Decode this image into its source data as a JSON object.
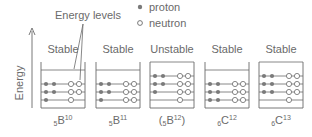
{
  "legend": {
    "proton_label": "proton",
    "neutron_label": "neutron"
  },
  "annotation": {
    "energy_levels": "Energy levels"
  },
  "axis": {
    "ylabel": "Energy"
  },
  "colors": {
    "proton_fill": "#7a7a7a",
    "neutron_fill": "#ffffff",
    "line": "#6a6a6a"
  },
  "nuclei": [
    {
      "stability": "Stable",
      "symbol": "B",
      "Z": "5",
      "A": "10",
      "paren": false,
      "levels": [
        {
          "protons": 1,
          "neutrons": 1
        },
        {
          "protons": 2,
          "neutrons": 2
        },
        {
          "protons": 2,
          "neutrons": 2
        }
      ]
    },
    {
      "stability": "Stable",
      "symbol": "B",
      "Z": "5",
      "A": "11",
      "paren": false,
      "levels": [
        {
          "protons": 1,
          "neutrons": 2
        },
        {
          "protons": 2,
          "neutrons": 2
        },
        {
          "protons": 2,
          "neutrons": 2
        }
      ]
    },
    {
      "stability": "Unstable",
      "symbol": "B",
      "Z": "5",
      "A": "12",
      "paren": true,
      "levels": [
        {
          "protons": 0,
          "neutrons": 1
        },
        {
          "protons": 1,
          "neutrons": 2
        },
        {
          "protons": 2,
          "neutrons": 2
        },
        {
          "protons": 2,
          "neutrons": 2
        }
      ]
    },
    {
      "stability": "Stable",
      "symbol": "C",
      "Z": "6",
      "A": "12",
      "paren": false,
      "levels": [
        {
          "protons": 2,
          "neutrons": 2
        },
        {
          "protons": 2,
          "neutrons": 2
        },
        {
          "protons": 2,
          "neutrons": 2
        }
      ]
    },
    {
      "stability": "Stable",
      "symbol": "C",
      "Z": "6",
      "A": "13",
      "paren": false,
      "levels": [
        {
          "protons": 0,
          "neutrons": 1
        },
        {
          "protons": 2,
          "neutrons": 2
        },
        {
          "protons": 2,
          "neutrons": 2
        },
        {
          "protons": 2,
          "neutrons": 2
        }
      ]
    }
  ]
}
